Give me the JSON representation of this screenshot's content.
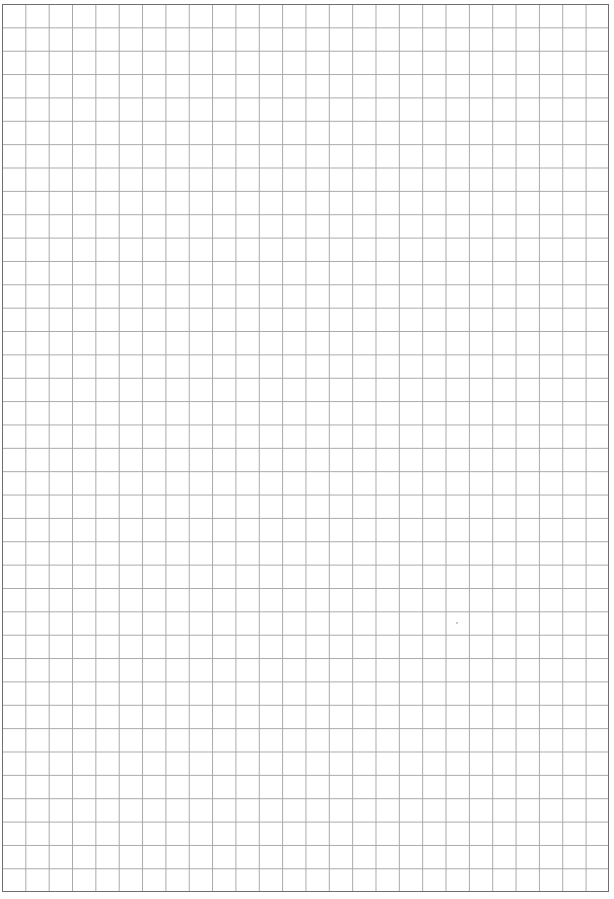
{
  "page": {
    "type": "grid-paper",
    "columns": 26,
    "rows": 38,
    "colors": {
      "background": "#ffffff",
      "grid_line": "#a8a8a8",
      "border": "#6e6e6e"
    }
  }
}
